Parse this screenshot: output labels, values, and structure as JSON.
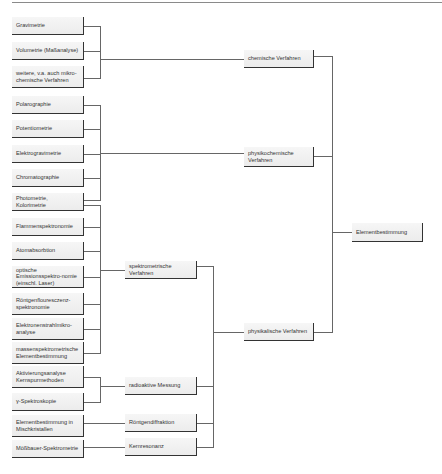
{
  "diagram": {
    "root": "Elementbestimmung",
    "level1": [
      {
        "id": "chem",
        "label": "chemische Verfahren"
      },
      {
        "id": "physchem",
        "label": "physikochemische Verfahren"
      },
      {
        "id": "phys",
        "label": "physikalische Verfahren"
      }
    ],
    "level2": [
      {
        "id": "spektro",
        "label": "spektrometrische Verfahren"
      },
      {
        "id": "radio",
        "label": "radioaktive Messung"
      },
      {
        "id": "roentgen",
        "label": "Röntgendiffraktion"
      },
      {
        "id": "kern",
        "label": "Kernresonanz"
      }
    ],
    "leaves": [
      {
        "label": "Gravimetrie",
        "parent": "chem"
      },
      {
        "label": "Volumetrie (Maßanalyse)",
        "parent": "chem"
      },
      {
        "label": "weitere, v.a. auch mikro-chemische Verfahren",
        "parent": "chem"
      },
      {
        "label": "Polarographie",
        "parent": "physchem"
      },
      {
        "label": "Potentiometrie",
        "parent": "physchem"
      },
      {
        "label": "Elektrogravimetrie",
        "parent": "physchem"
      },
      {
        "label": "Chromatographie",
        "parent": "physchem"
      },
      {
        "label": "Photometrie, Kolorimetrie",
        "parent": "physchem / spektro"
      },
      {
        "label": "Flammenspektronomie",
        "parent": "spektro"
      },
      {
        "label": "Atomabsorbtion",
        "parent": "spektro"
      },
      {
        "label": "optische Emissionsspektro-nomie (einschl. Laser)",
        "parent": "spektro"
      },
      {
        "label": "Röntgenflouresczenz-spektronomie",
        "parent": "spektro"
      },
      {
        "label": "Elektronenstrahlmikro-analyse",
        "parent": "spektro"
      },
      {
        "label": "massenspektrometrische Elementbestimmung",
        "parent": "spektro"
      },
      {
        "label": "Aktivierungsanalyse Kernspurmethoden",
        "parent": "radio"
      },
      {
        "label": "γ-Spektroskopie",
        "parent": "radio"
      },
      {
        "label": "Elementbestimmung in Mischkristallen",
        "parent": "roentgen"
      },
      {
        "label": "Mößbauer-Spektrometrie",
        "parent": "kern"
      }
    ]
  }
}
